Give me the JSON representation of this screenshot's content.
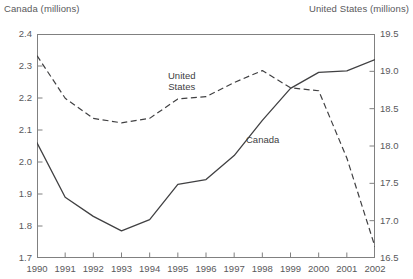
{
  "axis_titles": {
    "left": "Canada (millions)",
    "right": "United States (millions)"
  },
  "annotations": {
    "united_states_line1": "United",
    "united_states_line2": "States",
    "canada": "Canada"
  },
  "chart_data": {
    "type": "line",
    "title": "",
    "subtitle": "",
    "xlabel": "",
    "ylabel": "Canada (millions)",
    "y2label": "United States (millions)",
    "grid": false,
    "legend_position": "inline-annotation",
    "categories": [
      "1990",
      "1991",
      "1992",
      "1993",
      "1994",
      "1995",
      "1996",
      "1997",
      "1998",
      "1999",
      "2000",
      "2001",
      "2002"
    ],
    "x": [
      1990,
      1991,
      1992,
      1993,
      1994,
      1995,
      1996,
      1997,
      1998,
      1999,
      2000,
      2001,
      2002
    ],
    "xlim": [
      1990,
      2002
    ],
    "xticks": [
      "1990",
      "1991",
      "1992",
      "1993",
      "1994",
      "1995",
      "1996",
      "1997",
      "1998",
      "1999",
      "2000",
      "2001",
      "2002"
    ],
    "ylim": [
      1.7,
      2.4
    ],
    "yticks": [
      "1.7",
      "1.8",
      "1.9",
      "2.0",
      "2.1",
      "2.2",
      "2.3",
      "2.4"
    ],
    "y2lim": [
      16.5,
      19.5
    ],
    "y2ticks": [
      "16.5",
      "17.0",
      "17.5",
      "18.0",
      "18.5",
      "19.0",
      "19.5"
    ],
    "series": [
      {
        "name": "Canada",
        "axis": "left",
        "style": "solid",
        "color": "#404042",
        "units": "millions",
        "values": [
          2.06,
          1.89,
          1.83,
          1.785,
          1.82,
          1.93,
          1.945,
          2.02,
          2.13,
          2.23,
          2.28,
          2.285,
          2.32
        ]
      },
      {
        "name": "United States",
        "axis": "right",
        "style": "dashed",
        "color": "#404042",
        "units": "millions",
        "values": [
          19.21,
          18.64,
          18.37,
          18.31,
          18.37,
          18.63,
          18.66,
          18.85,
          19.01,
          18.78,
          18.74,
          17.84,
          16.65
        ]
      }
    ]
  }
}
